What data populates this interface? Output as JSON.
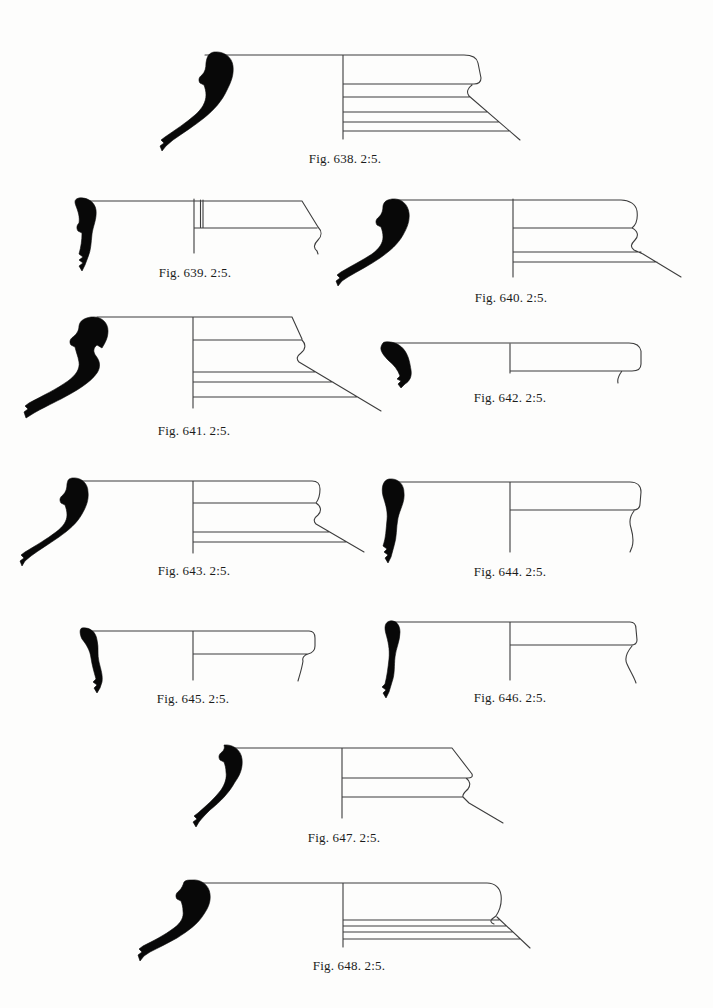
{
  "page": {
    "kind": "pottery figure plate",
    "background_color": "#fdfdfc",
    "line_color": "#3d3d3d",
    "profile_fill_color": "#080808"
  },
  "figures": [
    {
      "number": "638",
      "scale": "2:5",
      "caption": "Fig. 638. 2:5."
    },
    {
      "number": "639",
      "scale": "2:5",
      "caption": "Fig. 639. 2:5."
    },
    {
      "number": "640",
      "scale": "2:5",
      "caption": "Fig. 640. 2:5."
    },
    {
      "number": "641",
      "scale": "2:5",
      "caption": "Fig. 641. 2:5."
    },
    {
      "number": "642",
      "scale": "2:5",
      "caption": "Fig. 642. 2:5."
    },
    {
      "number": "643",
      "scale": "2:5",
      "caption": "Fig. 643. 2:5."
    },
    {
      "number": "644",
      "scale": "2:5",
      "caption": "Fig. 644. 2:5."
    },
    {
      "number": "645",
      "scale": "2:5",
      "caption": "Fig. 645. 2:5."
    },
    {
      "number": "646",
      "scale": "2:5",
      "caption": "Fig. 646. 2:5."
    },
    {
      "number": "647",
      "scale": "2:5",
      "caption": "Fig. 647. 2:5."
    },
    {
      "number": "648",
      "scale": "2:5",
      "caption": "Fig. 648. 2:5."
    }
  ]
}
